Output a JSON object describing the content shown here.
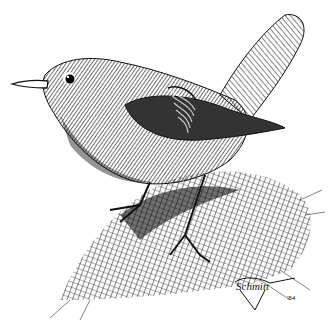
{
  "image": {
    "subject": "Pen-and-ink illustration of a small bird (wren-like) perched on a rock",
    "style": "black ink crosshatching on white",
    "signature": "Schmitt",
    "year": "'84",
    "colors": {
      "ink": "#111111",
      "paper": "#ffffff",
      "mid": "#555555"
    }
  }
}
